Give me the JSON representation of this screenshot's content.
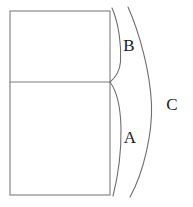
{
  "figure": {
    "type": "line-diagram",
    "background_color": "#ffffff",
    "stroke_color": "#7d7d7d",
    "label_color": "#1b1b1b",
    "canvas": {
      "width": 193,
      "height": 207
    },
    "rectangle": {
      "name": "two-cell-rectangle",
      "x": 10,
      "y": 11,
      "width": 100,
      "height": 184,
      "divider_y": 82
    },
    "curves": [
      {
        "name": "curve-b",
        "path": "M 112 8 C 119 24 121.5 46 120.5 62 C 119.6 72 115 78 110 82",
        "belongs_to_label": "B"
      },
      {
        "name": "curve-a",
        "path": "M 110 82 C 116 90 120.5 106 121 128 C 121.4 150 118 176 113 196",
        "belongs_to_label": "A"
      },
      {
        "name": "curve-c",
        "path": "M 128 7 C 140 34 150 72 151.5 104 C 152.6 132 144 172 130 197",
        "belongs_to_label": "C"
      }
    ],
    "labels": [
      {
        "name": "label-b",
        "text": "B",
        "x": 129,
        "y": 45
      },
      {
        "name": "label-a",
        "text": "A",
        "x": 130,
        "y": 137
      },
      {
        "name": "label-c",
        "text": "C",
        "x": 172,
        "y": 104
      }
    ]
  }
}
